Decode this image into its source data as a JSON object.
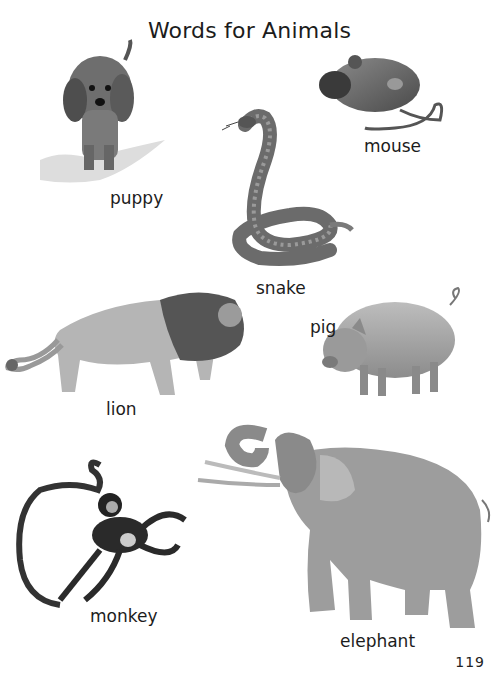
{
  "page": {
    "title": "Words for Animals",
    "page_number": "119"
  },
  "animals": [
    {
      "id": "puppy",
      "label": "puppy"
    },
    {
      "id": "mouse",
      "label": "mouse"
    },
    {
      "id": "snake",
      "label": "snake"
    },
    {
      "id": "lion",
      "label": "lion"
    },
    {
      "id": "pig",
      "label": "pig"
    },
    {
      "id": "monkey",
      "label": "monkey"
    },
    {
      "id": "elephant",
      "label": "elephant"
    }
  ]
}
